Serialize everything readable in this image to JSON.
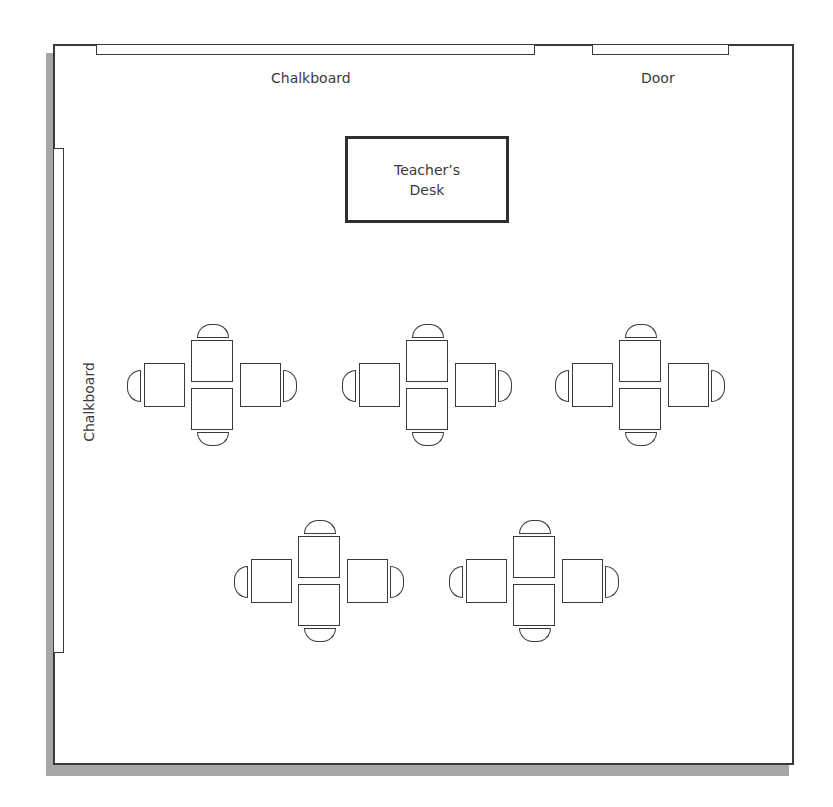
{
  "diagram": {
    "type": "classroom-floor-plan",
    "room": {
      "walls": "rectangular room with drop shadow"
    },
    "fixtures": {
      "top_chalkboard": {
        "label": "Chalkboard"
      },
      "door": {
        "label": "Door"
      },
      "left_chalkboard": {
        "label": "Chalkboard"
      }
    },
    "teacher_desk": {
      "line1": "Teacher’s",
      "line2": "Desk"
    },
    "student_clusters": [
      {
        "id": 1,
        "row": 1,
        "position": "left",
        "desks": 4,
        "chairs": 4
      },
      {
        "id": 2,
        "row": 1,
        "position": "center",
        "desks": 4,
        "chairs": 4
      },
      {
        "id": 3,
        "row": 1,
        "position": "right",
        "desks": 4,
        "chairs": 4
      },
      {
        "id": 4,
        "row": 2,
        "position": "left",
        "desks": 4,
        "chairs": 4
      },
      {
        "id": 5,
        "row": 2,
        "position": "right",
        "desks": 4,
        "chairs": 4
      }
    ],
    "totals": {
      "student_desks": 20,
      "student_chairs": 20,
      "clusters": 5
    }
  }
}
